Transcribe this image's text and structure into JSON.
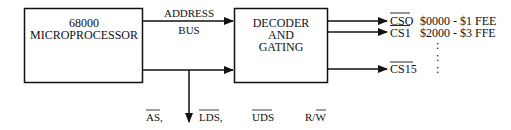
{
  "diagram": {
    "cpu_block": {
      "line1": "68000",
      "line2": "MICROPROCESSOR"
    },
    "bus_label": {
      "line1": "ADDRESS",
      "line2": "BUS"
    },
    "decoder_block": {
      "line1": "DECODER",
      "line2": "AND",
      "line3": "GATING"
    },
    "outputs": [
      {
        "signal": "CSO",
        "overbar": true,
        "range": "$0000 - $1 FEE"
      },
      {
        "signal": "CS1",
        "overbar": true,
        "range": "$2000 - $3 FFE"
      },
      {
        "signal": "CS15",
        "overbar": true,
        "range": ":"
      }
    ],
    "ellipsis": ":",
    "control_signals": [
      {
        "prefix": "",
        "bar": "AS",
        "suffix": ","
      },
      {
        "prefix": "",
        "bar": "LDS",
        "suffix": ","
      },
      {
        "prefix": "",
        "bar": "UDS",
        "suffix": ""
      },
      {
        "prefix": "R/",
        "bar": "W",
        "suffix": ""
      }
    ],
    "colors": {
      "line": "#111111",
      "background": "#ffffff"
    }
  }
}
